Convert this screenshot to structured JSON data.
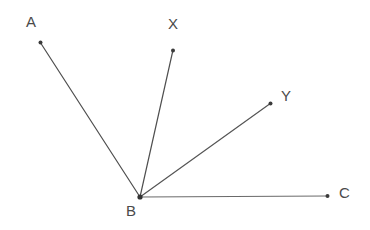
{
  "figure": {
    "background_color": "#ffffff",
    "line_color": "#555555",
    "label_color": "#4a4a4a",
    "vertex_dot_color": "#333333",
    "canvas": {
      "width": 370,
      "height": 230
    },
    "vertex": {
      "name": "B",
      "x": 140,
      "y": 197
    },
    "rays": [
      {
        "id": "ray-ba",
        "label": "A",
        "from": {
          "x": 140,
          "y": 197
        },
        "to": {
          "x": 40,
          "y": 42
        },
        "label_x": 26,
        "label_y": 14,
        "stroke_width": 1.2,
        "color": "#4f4f4f"
      },
      {
        "id": "ray-bx",
        "label": "X",
        "from": {
          "x": 140,
          "y": 197
        },
        "to": {
          "x": 173,
          "y": 50
        },
        "label_x": 168,
        "label_y": 16,
        "stroke_width": 1.2,
        "color": "#4f4f4f"
      },
      {
        "id": "ray-by",
        "label": "Y",
        "from": {
          "x": 140,
          "y": 197
        },
        "to": {
          "x": 271,
          "y": 103
        },
        "label_x": 281,
        "label_y": 88,
        "stroke_width": 1.2,
        "color": "#555555"
      },
      {
        "id": "ray-bc",
        "label": "C",
        "from": {
          "x": 140,
          "y": 197
        },
        "to": {
          "x": 328,
          "y": 196
        },
        "label_x": 339,
        "label_y": 185,
        "stroke_width": 1.1,
        "color": "#6a6a6a"
      }
    ],
    "vertex_label": {
      "text": "B",
      "label_x": 126,
      "label_y": 203
    },
    "labels": {
      "a": "A",
      "x": "X",
      "y": "Y",
      "c": "C",
      "b": "B"
    }
  }
}
